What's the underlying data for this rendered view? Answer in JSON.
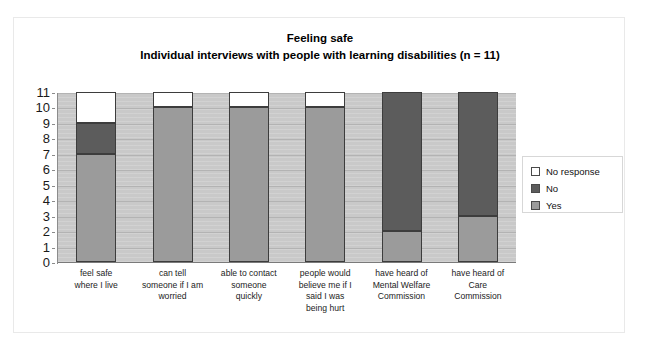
{
  "chart_data": {
    "type": "bar",
    "stacked": true,
    "title": "Feeling safe",
    "subtitle": "Individual interviews with people with learning disabilities (n = 11)",
    "xlabel": "",
    "ylabel": "",
    "ylim": [
      0,
      11
    ],
    "yticks": [
      0,
      1,
      2,
      3,
      4,
      5,
      6,
      7,
      8,
      9,
      10,
      11
    ],
    "ytick_labels": [
      "0",
      "1",
      "2",
      "3",
      "4",
      "5",
      "6",
      "7",
      "8",
      "9",
      "10",
      "11"
    ],
    "grid": true,
    "legend_position": "right",
    "categories": [
      "feel safe where I live",
      "can tell someone if I am worried",
      "able to contact someone quickly",
      "people would believe me if I said I was being hurt",
      "have heard of Mental Welfare Commission",
      "have heard of Care Commission"
    ],
    "category_label_lines": [
      [
        "feel safe",
        "where I live"
      ],
      [
        "can tell",
        "someone if I am",
        "worried"
      ],
      [
        "able to contact",
        "someone",
        "quickly"
      ],
      [
        "people would",
        "believe me if I",
        "said I was",
        "being hurt"
      ],
      [
        "have heard of",
        "Mental Welfare",
        "Commission"
      ],
      [
        "have heard of",
        "Care",
        "Commission"
      ]
    ],
    "series": [
      {
        "name": "Yes",
        "color": "#9b9b9b",
        "values": [
          7,
          10,
          10,
          10,
          2,
          3
        ]
      },
      {
        "name": "No",
        "color": "#5c5c5c",
        "values": [
          2,
          0,
          0,
          0,
          9,
          8
        ]
      },
      {
        "name": "No response",
        "color": "#ffffff",
        "values": [
          2,
          1,
          1,
          1,
          0,
          0
        ]
      }
    ],
    "stack_order_bottom_to_top": [
      "Yes",
      "No",
      "No response"
    ],
    "totals": [
      11,
      11,
      11,
      11,
      11,
      11
    ],
    "plot_background": "#c9c9c9",
    "bar_border_color": "#3d3d3d"
  },
  "legend": {
    "entries": [
      {
        "label": "No response",
        "swatch": "nores"
      },
      {
        "label": "No",
        "swatch": "no"
      },
      {
        "label": "Yes",
        "swatch": "yes"
      }
    ]
  }
}
